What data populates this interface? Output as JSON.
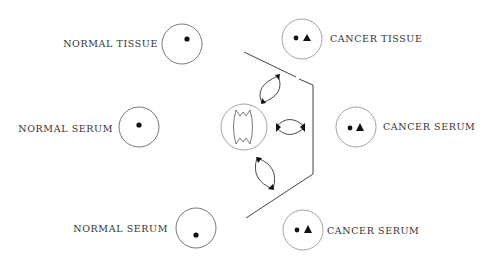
{
  "diagram": {
    "type": "immunodiffusion-plate",
    "wells": [
      {
        "id": "normal-tissue",
        "label": "NORMAL TISSUE",
        "markers": [
          "circle"
        ]
      },
      {
        "id": "cancer-tissue",
        "label": "CANCER TISSUE",
        "markers": [
          "circle",
          "triangle"
        ]
      },
      {
        "id": "normal-serum-mid",
        "label": "NORMAL SERUM",
        "markers": [
          "circle"
        ]
      },
      {
        "id": "cancer-serum-mid",
        "label": "CANCER SERUM",
        "markers": [
          "circle",
          "triangle"
        ]
      },
      {
        "id": "normal-serum-bottom",
        "label": "NORMAL SERUM",
        "markers": [
          "circle"
        ]
      },
      {
        "id": "cancer-serum-bottom",
        "label": "CANCER SERUM",
        "markers": [
          "circle",
          "triangle"
        ]
      },
      {
        "id": "center",
        "label": "",
        "markers": [
          "antiserum-shape"
        ]
      }
    ],
    "precipitin_arcs": 3
  },
  "labels": {
    "normal_tissue": "NORMAL TISSUE",
    "cancer_tissue": "CANCER TISSUE",
    "normal_serum_mid": "NORMAL SERUM",
    "cancer_serum_mid": "CANCER SERUM",
    "normal_serum_bottom": "NORMAL SERUM",
    "cancer_serum_bottom": "CANCER SERUM"
  }
}
